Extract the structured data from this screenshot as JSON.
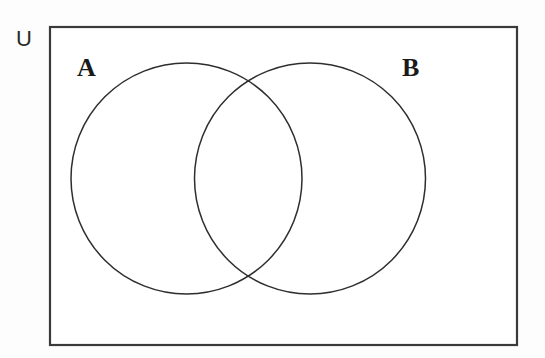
{
  "diagram": {
    "kind": "venn-2-set",
    "title_visible": false,
    "background_color": "#fdfdfd",
    "canvas": {
      "width": 545,
      "height": 358
    },
    "universe": {
      "label": "U",
      "label_x": 16,
      "label_y": 46,
      "rect": {
        "x": 50,
        "y": 27,
        "width": 467,
        "height": 318
      },
      "stroke_color": "#3a3a3a",
      "fill_color": "#ffffff",
      "stroke_width": 2.2
    },
    "sets": [
      {
        "label": "A",
        "label_x": 77,
        "label_y": 76,
        "cx": 186.5,
        "cy": 178.5,
        "r": 115.5,
        "stroke_color": "#2e2e2e",
        "fill": "none",
        "stroke_width": 1.5
      },
      {
        "label": "B",
        "label_x": 402,
        "label_y": 76,
        "cx": 310.0,
        "cy": 178.5,
        "r": 115.5,
        "stroke_color": "#2e2e2e",
        "fill": "none",
        "stroke_width": 1.5
      }
    ],
    "intersection": {
      "region_label": "",
      "upper_crossing": {
        "x": 248,
        "y": 76
      },
      "lower_crossing": {
        "x": 248,
        "y": 281
      },
      "shaded": false
    },
    "region_labels": []
  }
}
